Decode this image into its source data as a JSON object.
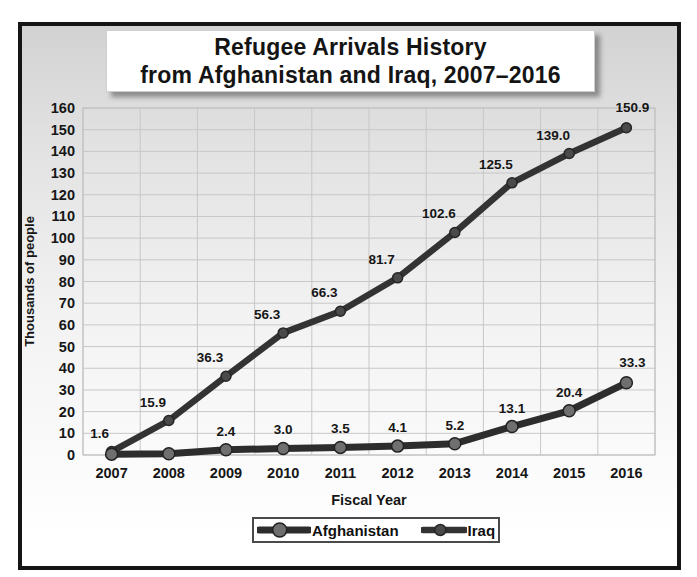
{
  "title": {
    "line1": "Refugee Arrivals History",
    "line2": "from Afghanistan and Iraq, 2007–2016"
  },
  "chart_data": {
    "type": "line",
    "title": "Refugee Arrivals History from Afghanistan and Iraq, 2007–2016",
    "xlabel": "Fiscal Year",
    "ylabel": "Thousands of people",
    "ylim": [
      0,
      160
    ],
    "ytick_step": 10,
    "grid": true,
    "legend_position": "bottom",
    "categories": [
      "2007",
      "2008",
      "2009",
      "2010",
      "2011",
      "2012",
      "2013",
      "2014",
      "2015",
      "2016"
    ],
    "series": [
      {
        "name": "Iraq",
        "values": [
          1.6,
          15.9,
          36.3,
          56.3,
          66.3,
          81.7,
          102.6,
          125.5,
          139.0,
          150.9
        ],
        "labels": [
          "1.6",
          "15.9",
          "36.3",
          "56.3",
          "66.3",
          "81.7",
          "102.6",
          "125.5",
          "139.0",
          "150.9"
        ],
        "line_color": "#333333",
        "marker_color": "#4a4a4a",
        "marker_edge": "#262626",
        "line_width": 6.5,
        "marker_radius": 5,
        "label_dx": -16,
        "label_dy": -14,
        "label_offsets": {
          "0": [
            -12,
            -14
          ],
          "9": [
            6,
            -16
          ]
        }
      },
      {
        "name": "Afghanistan",
        "values": [
          0.4,
          0.6,
          2.4,
          3.0,
          3.5,
          4.1,
          5.2,
          13.1,
          20.4,
          33.3
        ],
        "labels": [
          null,
          null,
          "2.4",
          "3.0",
          "3.5",
          "4.1",
          "5.2",
          "13.1",
          "20.4",
          "33.3"
        ],
        "line_color": "#2d2d2d",
        "marker_color": "#6f6f6f",
        "marker_edge": "#222222",
        "line_width": 7,
        "marker_radius": 6,
        "label_dx": 0,
        "label_dy": -14,
        "label_offsets": {
          "9": [
            6,
            -16
          ]
        }
      }
    ],
    "style": {
      "grid_color": "#c7c7c7",
      "plot_border_color": "#bfbfbf",
      "text_color": "#161616",
      "frame_border_color": "#151515"
    }
  },
  "legend": {
    "items": [
      {
        "label": "Afghanistan",
        "series_index": 1
      },
      {
        "label": "Iraq",
        "series_index": 0
      }
    ]
  }
}
